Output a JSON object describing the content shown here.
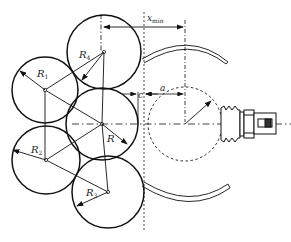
{
  "diagram": {
    "labels": {
      "R4": "R",
      "R4_sub": "4",
      "R1": "R",
      "R1_sub": "1",
      "R": "R",
      "R2": "R",
      "R2_sub": "2",
      "R3": "R",
      "R3_sub": "3",
      "c": "c",
      "a": "a",
      "xmin": "x",
      "xmin_sub": "min"
    },
    "circles": [
      {
        "id": "R4",
        "cx": 104,
        "cy": 52,
        "r": 37
      },
      {
        "id": "R1",
        "cx": 45,
        "cy": 90,
        "r": 33
      },
      {
        "id": "R",
        "cx": 102,
        "cy": 124,
        "r": 36
      },
      {
        "id": "R2",
        "cx": 46,
        "cy": 160,
        "r": 34
      },
      {
        "id": "R3",
        "cx": 108,
        "cy": 192,
        "r": 36
      }
    ],
    "colors": {
      "stroke": "#111111",
      "background": "#ffffff"
    }
  }
}
